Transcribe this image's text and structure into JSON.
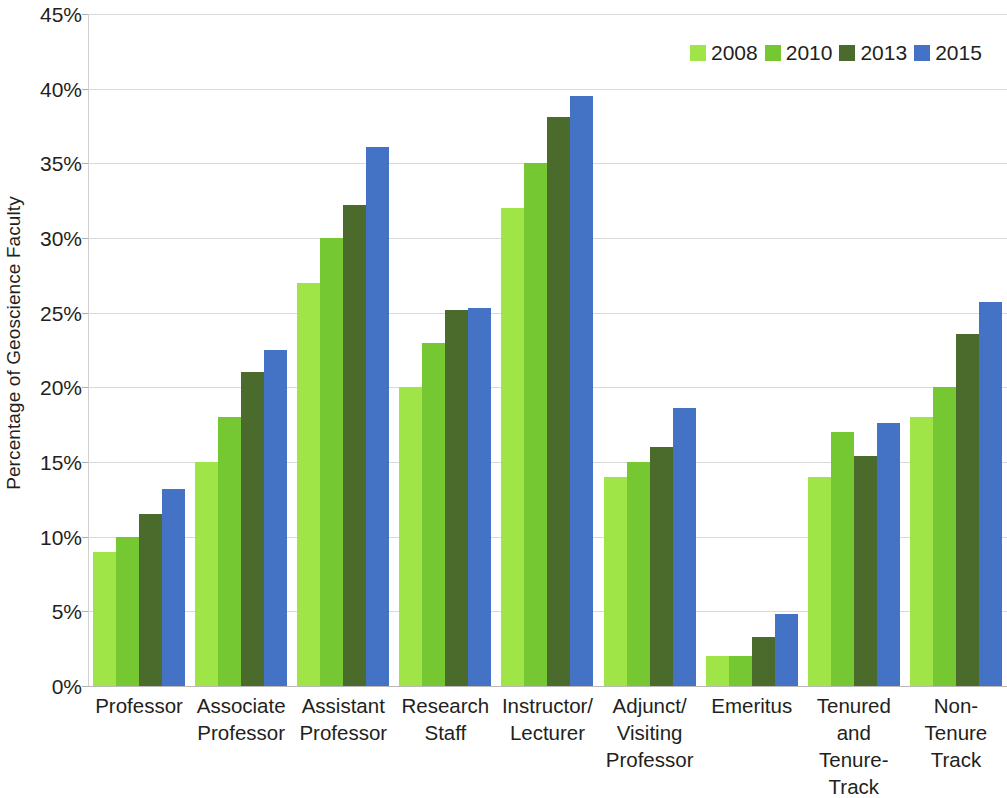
{
  "chart_data": {
    "type": "bar",
    "title": "",
    "xlabel": "",
    "ylabel": "Percentage of Geoscience Faculty",
    "ylim": [
      0,
      45
    ],
    "ytick_labels": [
      "45%",
      "40%",
      "35%",
      "30%",
      "25%",
      "20%",
      "15%",
      "10%",
      "5%",
      "0%"
    ],
    "ytick_values": [
      45,
      40,
      35,
      30,
      25,
      20,
      15,
      10,
      5,
      0
    ],
    "grid": true,
    "legend_position": "top-right",
    "categories": [
      "Professor",
      "Associate\nProfessor",
      "Assistant\nProfessor",
      "Research\nStaff",
      "Instructor/\nLecturer",
      "Adjunct/\nVisiting\nProfessor",
      "Emeritus",
      "Tenured\nand\nTenure-Track",
      "Non-\nTenure\nTrack"
    ],
    "series": [
      {
        "name": "2008",
        "color": "#9fe547",
        "values": [
          9.0,
          15.0,
          27.0,
          20.0,
          32.0,
          14.0,
          2.0,
          14.0,
          18.0
        ]
      },
      {
        "name": "2010",
        "color": "#76c832",
        "values": [
          10.0,
          18.0,
          30.0,
          23.0,
          35.0,
          15.0,
          2.0,
          17.0,
          20.0
        ]
      },
      {
        "name": "2013",
        "color": "#4a6b2c",
        "values": [
          11.5,
          21.0,
          32.2,
          25.2,
          38.1,
          16.0,
          3.3,
          15.4,
          23.6
        ]
      },
      {
        "name": "2015",
        "color": "#4472c4",
        "values": [
          13.2,
          22.5,
          36.1,
          25.3,
          39.5,
          18.6,
          4.8,
          17.6,
          25.7
        ]
      }
    ]
  },
  "legend": {
    "items": [
      {
        "label": "2008",
        "color": "#9fe547"
      },
      {
        "label": "2010",
        "color": "#76c832"
      },
      {
        "label": "2013",
        "color": "#4a6b2c"
      },
      {
        "label": "2015",
        "color": "#4472c4"
      }
    ]
  }
}
